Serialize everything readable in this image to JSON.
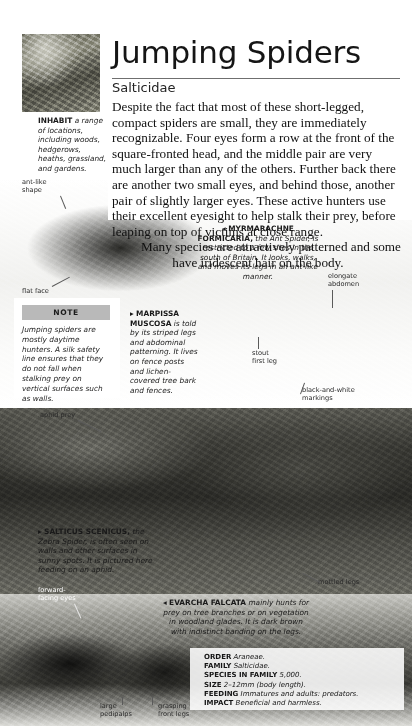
{
  "header": {
    "title": "Jumping Spiders",
    "family_name": "Salticidae"
  },
  "intro": {
    "paragraph_1": "Despite the fact that most of these short-legged, compact spiders are small, they are immediately recognizable. Four eyes form a row at the front of the square-fronted head, and the middle pair are very much larger than any of the others. Further back there are another two small eyes, and behind those, another pair of slightly larger eyes. These active hunters use their excellent eyesight to help stalk their prey, before leaping on top of victims at close range.",
    "paragraph_2": "Many species are attractively patterned and some have iridescent hair on the body."
  },
  "captions": {
    "inhabit": {
      "lead_in": "INHABIT",
      "text": "a range of locations, including woods, hedgerows, heaths, grassland, and gardens."
    },
    "myrmarachne": {
      "marker": "◂",
      "name": "MYRMARACHNE FORMICARIA,",
      "text": "the Ant Spider, is restricted to a few sites in the south of Britain. It looks, walks, and moves its legs in an ant-like manner."
    },
    "marpissa": {
      "marker": "▸",
      "name": "MARPISSA MUSCOSA",
      "text": "is told by its striped legs and abdominal patterning. It lives on fence posts and lichen-covered tree bark and fences."
    },
    "salticus": {
      "marker": "▸",
      "name": "SALTICUS SCENICUS,",
      "text": "the Zebra Spider, is often seen on walls and other surfaces in sunny spots. It is pictured here feeding on an aphid."
    },
    "evarcha": {
      "marker": "◂",
      "name": "EVARCHA FALCATA",
      "text": "mainly hunts for prey on tree branches or on vegetation in woodland glades. It is dark brown with indistinct banding on the legs."
    }
  },
  "note": {
    "header": "NOTE",
    "body": "Jumping spiders are mostly daytime hunters. A silk safety line ensures that they do not fall when stalking prey on vertical surfaces such as walls."
  },
  "leader_labels": {
    "ant_like_shape": "ant-like\nshape",
    "flat_face": "flat face",
    "elongate_abdomen": "elongate\nabdomen",
    "black_and_white_markings": "black-and-white\nmarkings",
    "stout_first_leg": "stout\nfirst leg",
    "aphid_prey": "aphid prey",
    "forward_facing_eyes": "forward-\nfacing eyes",
    "mottled_legs": "mottled legs",
    "large_pedipalps": "large\npedipalps",
    "grasping_front_legs": "grasping\nfront legs"
  },
  "data_panel": {
    "rows": [
      {
        "key": "ORDER",
        "value": "Araneae."
      },
      {
        "key": "FAMILY",
        "value": "Salticidae."
      },
      {
        "key": "SPECIES IN FAMILY",
        "value": "5,000."
      },
      {
        "key": "SIZE",
        "value": "2–12mm (body length)."
      },
      {
        "key": "FEEDING",
        "value": "Immatures and adults: predators."
      },
      {
        "key": "IMPACT",
        "value": "Beneficial and harmless."
      }
    ]
  },
  "colors": {
    "note_header_bg": "#b9b9b9",
    "rule": "#6f6f6f",
    "text": "#111111"
  }
}
